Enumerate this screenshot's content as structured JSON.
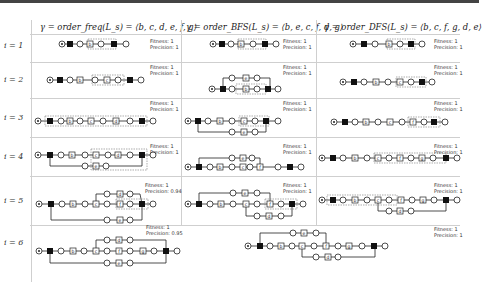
{
  "columns": [
    {
      "header": "γ = order_freq(L_s) = ⟨b, c, d, e, f, g⟩"
    },
    {
      "header": "γ = order_BFS(L_s) = ⟨b, e, c, f, d, g⟩"
    },
    {
      "header": "γ = order_DFS(L_s) = ⟨b, c, f, g, d, e⟩"
    }
  ],
  "rows": [
    {
      "label": "i = 1",
      "cells": [
        {
          "fitness": "Fitness: 1",
          "precision": "Precision: 1",
          "activities": [
            "b"
          ]
        },
        {
          "fitness": "Fitness: 1",
          "precision": "Precision: 1",
          "activities": [
            "b"
          ]
        },
        {
          "fitness": "Fitness: 1",
          "precision": "Precision: 1",
          "activities": [
            "b"
          ]
        }
      ]
    },
    {
      "label": "i = 2",
      "cells": [
        {
          "fitness": "Fitness: 1",
          "precision": "Precision: 1",
          "activities": [
            "b",
            "c"
          ]
        },
        {
          "fitness": "Fitness: 1",
          "precision": "Precision: 1",
          "activities": [
            "e",
            "b"
          ]
        },
        {
          "fitness": "Fitness: 1",
          "precision": "Precision: 1",
          "activities": [
            "b",
            "c"
          ]
        }
      ]
    },
    {
      "label": "i = 3",
      "cells": [
        {
          "fitness": "Fitness: 1",
          "precision": "Precision: 1",
          "activities": [
            "b",
            "c",
            "d"
          ]
        },
        {
          "fitness": "Fitness: 1",
          "precision": "Precision: 1",
          "activities": [
            "b",
            "c",
            "e"
          ]
        },
        {
          "fitness": "Fitness: 1",
          "precision": "Precision: 1",
          "activities": [
            "b",
            "c",
            "f"
          ]
        }
      ]
    },
    {
      "label": "i = 4",
      "cells": [
        {
          "fitness": "Fitness: 1",
          "precision": "Precision: 1",
          "activities": [
            "b",
            "c",
            "d",
            "e"
          ]
        },
        {
          "fitness": "Fitness: 1",
          "precision": "Precision: 1",
          "activities": [
            "e",
            "b",
            "c",
            "f"
          ]
        },
        {
          "fitness": "Fitness: 1",
          "precision": "Precision: 1",
          "activities": [
            "b",
            "c",
            "f",
            "g"
          ]
        }
      ]
    },
    {
      "label": "i = 5",
      "cells": [
        {
          "fitness": "Fitness: 1",
          "precision": "Precision: 0.94",
          "activities": [
            "b",
            "c",
            "d",
            "f",
            "e"
          ]
        },
        {
          "fitness": "Fitness: 1",
          "precision": "Precision: 1",
          "activities": [
            "e",
            "b",
            "c",
            "f",
            "d"
          ]
        },
        {
          "fitness": "Fitness: 1",
          "precision": "Precision: 1",
          "activities": [
            "b",
            "c",
            "f",
            "g",
            "d"
          ]
        }
      ]
    },
    {
      "label": "i = 6",
      "cells": [
        {
          "fitness": "Fitness: 1",
          "precision": "Precision: 0.95",
          "activities": [
            "b",
            "c",
            "d",
            "f",
            "g",
            "e"
          ]
        },
        {
          "fitness": "Fitness: 1",
          "precision": "Precision: 1",
          "activities": [
            "e",
            "b",
            "c",
            "f",
            "g",
            "d"
          ]
        }
      ]
    }
  ],
  "colors": {
    "line": "#222222",
    "grid": "#cfcfcf",
    "highlight": "#888888"
  }
}
